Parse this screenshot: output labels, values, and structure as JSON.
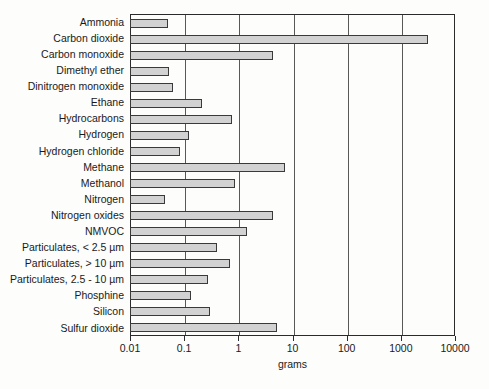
{
  "chart_data": {
    "type": "bar",
    "orientation": "horizontal",
    "title": "",
    "xlabel": "grams",
    "ylabel": "",
    "xscale": "log",
    "xlim": [
      0.01,
      10000
    ],
    "xticks": [
      "0.01",
      "0.1",
      "1",
      "10",
      "100",
      "1000",
      "10000"
    ],
    "grid": true,
    "legend": "none",
    "bar_color": "#d2d2d2",
    "bar_edge_color": "#3a3a3a",
    "axis_color": "#2b2b2b",
    "categories": [
      "Ammonia",
      "Carbon dioxide",
      "Carbon monoxide",
      "Dimethyl ether",
      "Dinitrogen monoxide",
      "Ethane",
      "Hydrocarbons",
      "Hydrogen",
      "Hydrogen chloride",
      "Methane",
      "Methanol",
      "Nitrogen",
      "Nitrogen oxides",
      "NMVOC",
      "Particulates, < 2.5 µm",
      "Particulates, > 10 µm",
      "Particulates, 2.5 - 10 µm",
      "Phosphine",
      "Silicon",
      "Sulfur dioxide"
    ],
    "values": [
      0.05,
      3160,
      4.3,
      0.052,
      0.062,
      0.21,
      0.76,
      0.123,
      0.084,
      7.2,
      0.87,
      0.045,
      4.3,
      1.45,
      0.4,
      0.7,
      0.28,
      0.135,
      0.3,
      5.1
    ]
  }
}
